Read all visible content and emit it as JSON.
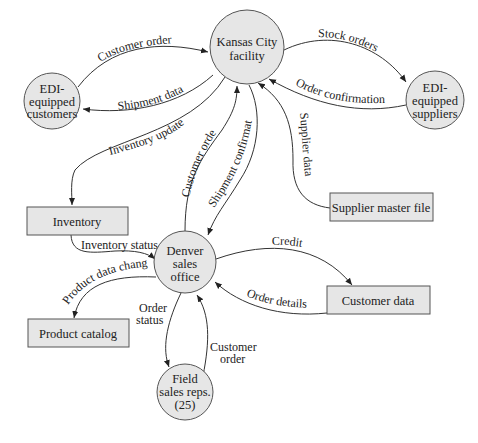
{
  "diagram": {
    "type": "data-flow-diagram",
    "nodes": {
      "kansas_city": {
        "lines": [
          "Kansas City",
          "facility"
        ],
        "shape": "circle"
      },
      "edi_customers": {
        "lines": [
          "EDI-",
          "equipped",
          "customers"
        ],
        "shape": "circle"
      },
      "edi_suppliers": {
        "lines": [
          "EDI-",
          "equipped",
          "suppliers"
        ],
        "shape": "circle"
      },
      "denver": {
        "lines": [
          "Denver",
          "sales",
          "office"
        ],
        "shape": "circle"
      },
      "field_sales": {
        "lines": [
          "Field",
          "sales reps.",
          "(25)"
        ],
        "shape": "circle"
      },
      "inventory": {
        "label": "Inventory",
        "shape": "box"
      },
      "supplier_master": {
        "label": "Supplier master file",
        "shape": "box"
      },
      "product_catalog": {
        "label": "Product catalog",
        "shape": "box"
      },
      "customer_data": {
        "label": "Customer data",
        "shape": "box"
      }
    },
    "edges": {
      "customer_order_top": "Customer order",
      "shipment_data": "Shipment data",
      "stock_orders": "Stock orders",
      "order_confirmation": "Order confirmation",
      "inventory_update": "Inventory update",
      "customer_order_mid": "Customer order",
      "shipment_confirmation": "Shipment confirmation",
      "supplier_data": "Supplier data",
      "inventory_status": "Inventory status",
      "product_data_changes": "Product data changes",
      "credit": "Credit",
      "order_details": "Order details",
      "order_status_1": "Order",
      "order_status_2": "status",
      "customer_order_bottom_1": "Customer",
      "customer_order_bottom_2": "order"
    },
    "colors": {
      "node_fill": "#e6e6e6",
      "stroke": "#555555",
      "text": "#222222"
    }
  }
}
